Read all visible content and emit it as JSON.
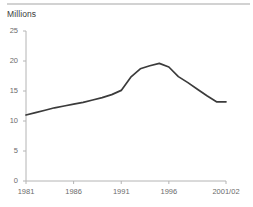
{
  "figure": {
    "top_rule": "divider",
    "axis_title": "Millions"
  },
  "chart_data": {
    "type": "line",
    "title": "",
    "subtitle": "",
    "xlabel": "",
    "ylabel": "Millions",
    "ylim": [
      0,
      25
    ],
    "xlim": [
      1981,
      2002
    ],
    "grid": false,
    "legend": "none",
    "line_color": "#3b3b3b",
    "axis_color": "#b4b4b4",
    "y_ticks": [
      0,
      5,
      10,
      15,
      20,
      25
    ],
    "y_tick_labels": [
      "0",
      "5",
      "10",
      "15",
      "20",
      "25"
    ],
    "x_ticks": [
      1981,
      1986,
      1991,
      1996,
      2002
    ],
    "x_tick_labels": [
      "1981",
      "1986",
      "1991",
      "1996",
      "2001/02"
    ],
    "x": [
      1981,
      1982,
      1983,
      1984,
      1985,
      1986,
      1987,
      1988,
      1989,
      1990,
      1991,
      1992,
      1993,
      1994,
      1995,
      1996,
      1997,
      1998,
      1999,
      2000,
      2001,
      2002
    ],
    "values": [
      11.0,
      11.4,
      11.8,
      12.2,
      12.5,
      12.8,
      13.1,
      13.5,
      13.9,
      14.4,
      15.1,
      17.3,
      18.7,
      19.2,
      19.6,
      19.0,
      17.4,
      16.4,
      15.3,
      14.2,
      13.2,
      13.2
    ],
    "series": [
      {
        "name": "Millions",
        "values": [
          11.0,
          11.4,
          11.8,
          12.2,
          12.5,
          12.8,
          13.1,
          13.5,
          13.9,
          14.4,
          15.1,
          17.3,
          18.7,
          19.2,
          19.6,
          19.0,
          17.4,
          16.4,
          15.3,
          14.2,
          13.2,
          13.2
        ]
      }
    ],
    "annotations": []
  }
}
